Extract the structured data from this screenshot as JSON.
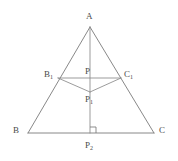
{
  "figure": {
    "type": "geometry-diagram",
    "stroke_color": "#7a7a7a",
    "label_color": "#4a4a4a",
    "background_color": "#ffffff",
    "width": 178,
    "height": 161
  },
  "labels": {
    "apex": "A",
    "bottom_left": "B",
    "bottom_right": "C",
    "left_mid": "B",
    "left_mid_sub": "1",
    "right_mid": "C",
    "right_mid_sub": "1",
    "inner_top": "P",
    "inner_top_sub": "",
    "inner_mid": "P",
    "inner_mid_sub": "1",
    "foot": "P",
    "foot_sub": "2"
  },
  "points": {
    "A": {
      "x": 90,
      "y": 27
    },
    "B": {
      "x": 28,
      "y": 133
    },
    "C": {
      "x": 154,
      "y": 133
    },
    "B1": {
      "x": 58,
      "y": 78
    },
    "C1": {
      "x": 121,
      "y": 78
    },
    "P": {
      "x": 90,
      "y": 78
    },
    "P1": {
      "x": 90,
      "y": 92
    },
    "P2": {
      "x": 90,
      "y": 133
    }
  },
  "segments": [
    {
      "name": "side-AB",
      "from": "A",
      "to": "B"
    },
    {
      "name": "side-AC",
      "from": "A",
      "to": "C"
    },
    {
      "name": "base-BC",
      "from": "B",
      "to": "C"
    },
    {
      "name": "altitude-A-P2",
      "from": "A",
      "to": "P2"
    },
    {
      "name": "midline-B1-C1",
      "from": "B1",
      "to": "C1"
    },
    {
      "name": "segment-B1-P1",
      "from": "B1",
      "to": "P1"
    },
    {
      "name": "segment-C1-P1",
      "from": "C1",
      "to": "P1"
    }
  ],
  "markers": {
    "right_angle": {
      "name": "right-angle-at-P2",
      "vertex_x": 90,
      "vertex_y": 133,
      "size": 6
    }
  }
}
